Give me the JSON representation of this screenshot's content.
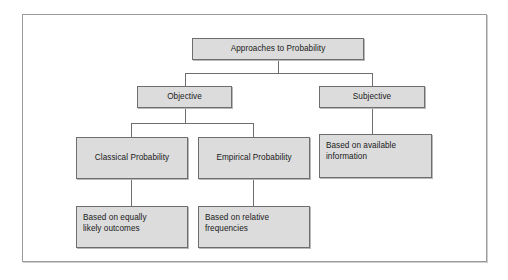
{
  "figure": {
    "background_color": "#ffffff",
    "frame_border_color": "#9a9a9a",
    "node_fill_color": "#dcdcdc",
    "node_border_color": "#6e6e6e",
    "connector_color": "#6e6e6e",
    "text_color": "#1a1a1a"
  },
  "nodes": {
    "root": {
      "label": "Approaches to Probability"
    },
    "objective": {
      "label": "Objective"
    },
    "subjective": {
      "label": "Subjective"
    },
    "classical": {
      "label": "Classical Probability"
    },
    "empirical": {
      "label": "Empirical Probability"
    },
    "available_information": {
      "label": "Based on available\ninformation"
    },
    "equally_likely": {
      "label": "Based on equally\nlikely outcomes"
    },
    "relative_frequencies": {
      "label": "Based on relative\nfrequencies"
    }
  },
  "edges": [
    {
      "from": "root",
      "to": "objective"
    },
    {
      "from": "root",
      "to": "subjective"
    },
    {
      "from": "objective",
      "to": "classical"
    },
    {
      "from": "objective",
      "to": "empirical"
    },
    {
      "from": "subjective",
      "to": "available_information"
    },
    {
      "from": "classical",
      "to": "equally_likely"
    },
    {
      "from": "empirical",
      "to": "relative_frequencies"
    }
  ]
}
